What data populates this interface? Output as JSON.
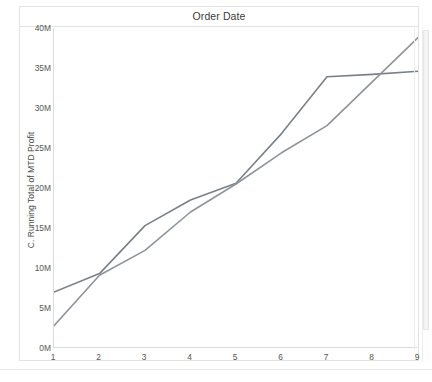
{
  "chart_data": {
    "type": "line",
    "title": "Order Date",
    "xlabel": "",
    "ylabel": "C. Running Total of MTD Profit",
    "x": [
      1,
      2,
      3,
      4,
      5,
      6,
      7,
      8,
      9
    ],
    "xtick_labels": [
      "1",
      "2",
      "3",
      "4",
      "5",
      "6",
      "7",
      "8",
      "9"
    ],
    "ytick_labels": [
      "0M",
      "5M",
      "10M",
      "15M",
      "20M",
      "25M",
      "30M",
      "35M",
      "40M"
    ],
    "ytick_values": [
      0,
      5000000,
      10000000,
      15000000,
      20000000,
      25000000,
      30000000,
      35000000,
      40000000
    ],
    "ylim": [
      0,
      40000000
    ],
    "xlim": [
      1,
      9
    ],
    "grid": false,
    "legend": "none",
    "series": [
      {
        "name": "Series 1",
        "color": "#7b8088",
        "values": [
          7000000,
          9300000,
          15300000,
          18500000,
          20600000,
          26800000,
          33900000,
          34200000,
          34600000
        ]
      },
      {
        "name": "Series 2",
        "color": "#8f949b",
        "values": [
          2800000,
          9100000,
          12200000,
          17000000,
          20500000,
          24400000,
          27800000,
          33300000,
          38800000
        ]
      }
    ]
  },
  "scrollbar": {
    "name": "vertical-scrollbar"
  }
}
